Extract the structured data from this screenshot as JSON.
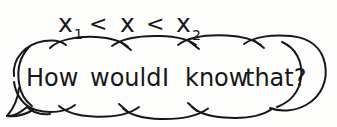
{
  "canvas": {
    "width": 337,
    "height": 127,
    "background_color": "#fdfdfc",
    "ink_color": "#17161a"
  },
  "annotation": {
    "name": "inequality-expression",
    "full_text": "x1 < x < x2",
    "tokens": [
      {
        "base": "x",
        "subscript": "1"
      },
      {
        "base": "<",
        "subscript": ""
      },
      {
        "base": "x",
        "subscript": ""
      },
      {
        "base": "<",
        "subscript": ""
      },
      {
        "base": "x",
        "subscript": "2"
      }
    ]
  },
  "speech_bubble": {
    "name": "cloud-speech-bubble",
    "style": "hand-drawn scalloped cloud outline with crossing arc junctions",
    "tail": "pointed tail at bottom-left",
    "text": "How would I know that?",
    "words": [
      "How",
      "would",
      "I",
      "know",
      "that?"
    ]
  }
}
